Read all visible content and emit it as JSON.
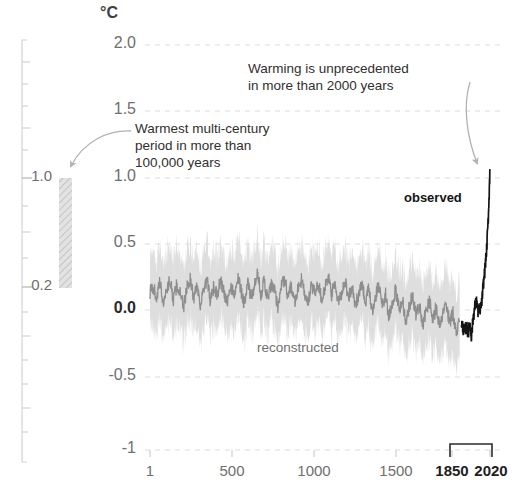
{
  "figure": {
    "unit_label": "°C",
    "annotations": {
      "right": {
        "line1": "Warming is unprecedented",
        "line2": "in more than 2000 years"
      },
      "left": {
        "line1": "Warmest multi-century",
        "line2": "period in more than",
        "line3": "100,000 years"
      }
    },
    "series_labels": {
      "observed": "observed",
      "reconstructed": "reconstructed"
    },
    "secondary_axis": {
      "ticks": [
        "1.0",
        "0.2"
      ],
      "bar_top_value": 1.0,
      "bar_bottom_value": 0.2
    },
    "colors": {
      "band": "#cfcfcf",
      "reconstructed_line": "#8c8c8c",
      "observed_line": "#1a1a1a",
      "gridline": "#dedede",
      "axis": "#c9c9c9",
      "text": "#6e6e6e",
      "text_dark": "#1d1d1d"
    }
  },
  "chart_data": {
    "type": "line",
    "title": "",
    "subtitle": "",
    "xlabel": "",
    "ylabel": "°C",
    "xlim": [
      1,
      2020
    ],
    "ylim": [
      -1,
      2.0
    ],
    "grid": true,
    "legend": "inline-annotation",
    "y_ticks": [
      "2.0",
      "1.5",
      "1.0",
      "0.5",
      "0.0",
      "-0.5",
      "-1"
    ],
    "y_tick_values": [
      2.0,
      1.5,
      1.0,
      0.5,
      0.0,
      -0.5,
      -1.0
    ],
    "x_ticks": [
      "1",
      "500",
      "1000",
      "1500",
      "1850",
      "2020"
    ],
    "x_tick_values": [
      1,
      500,
      1000,
      1500,
      1850,
      2020
    ],
    "x_ticks_bold": [
      "1850",
      "2020"
    ],
    "bracket_range": [
      1850,
      2020
    ],
    "series": [
      {
        "name": "reconstructed",
        "kind": "line-with-uncertainty-band",
        "band_half_width": 0.28,
        "x": [
          1,
          20,
          40,
          60,
          80,
          100,
          120,
          140,
          160,
          180,
          200,
          220,
          240,
          260,
          280,
          300,
          320,
          340,
          360,
          380,
          400,
          420,
          440,
          460,
          480,
          500,
          520,
          540,
          560,
          580,
          600,
          620,
          640,
          660,
          680,
          700,
          720,
          740,
          760,
          780,
          800,
          820,
          840,
          860,
          880,
          900,
          920,
          940,
          960,
          980,
          1000,
          1020,
          1040,
          1060,
          1080,
          1100,
          1120,
          1140,
          1160,
          1180,
          1200,
          1220,
          1240,
          1260,
          1280,
          1300,
          1320,
          1340,
          1360,
          1380,
          1400,
          1420,
          1440,
          1460,
          1480,
          1500,
          1520,
          1540,
          1560,
          1580,
          1600,
          1620,
          1640,
          1660,
          1680,
          1700,
          1720,
          1740,
          1760,
          1780,
          1800,
          1820,
          1840
        ],
        "values": [
          0.17,
          0.21,
          0.13,
          0.24,
          0.09,
          0.19,
          0.26,
          0.11,
          0.22,
          0.16,
          0.05,
          0.2,
          0.27,
          0.12,
          0.23,
          0.08,
          0.18,
          0.25,
          0.1,
          0.21,
          0.14,
          0.26,
          0.17,
          0.07,
          0.22,
          0.15,
          0.28,
          0.19,
          0.09,
          0.24,
          0.13,
          0.2,
          0.3,
          0.16,
          0.25,
          0.11,
          0.22,
          0.18,
          0.06,
          0.21,
          0.27,
          0.14,
          0.23,
          0.1,
          0.19,
          0.26,
          0.15,
          0.08,
          0.22,
          0.17,
          0.24,
          0.12,
          0.2,
          0.28,
          0.15,
          0.23,
          0.09,
          0.18,
          0.25,
          0.13,
          0.21,
          0.06,
          0.16,
          0.24,
          0.1,
          0.19,
          0.02,
          0.14,
          0.22,
          0.07,
          0.16,
          -0.02,
          0.1,
          0.18,
          0.04,
          0.12,
          -0.05,
          0.06,
          0.15,
          0.01,
          0.08,
          -0.08,
          0.03,
          0.11,
          -0.03,
          0.05,
          -0.1,
          0.0,
          0.09,
          -0.06,
          0.02,
          -0.12,
          -0.04
        ]
      },
      {
        "name": "observed",
        "kind": "line",
        "x": [
          1850,
          1860,
          1870,
          1880,
          1890,
          1900,
          1910,
          1920,
          1930,
          1940,
          1950,
          1960,
          1970,
          1980,
          1990,
          2000,
          2010,
          2020
        ],
        "values": [
          -0.05,
          -0.1,
          -0.12,
          -0.08,
          -0.14,
          -0.06,
          -0.16,
          -0.02,
          0.06,
          0.1,
          0.02,
          0.04,
          0.08,
          0.22,
          0.34,
          0.48,
          0.72,
          1.08
        ]
      }
    ],
    "annotation_markers": [
      {
        "name": "warmest-multi-century-bar",
        "value_top": 1.0,
        "value_bottom": 0.2,
        "style": "hatched-gray-bar"
      }
    ]
  }
}
